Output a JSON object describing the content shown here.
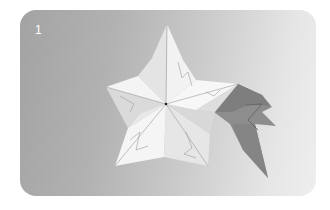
{
  "photo": {
    "step_number": "1",
    "subject": "origami-star",
    "colors": {
      "background_left": "#a3a3a3",
      "background_right": "#eeeeee",
      "paper_light": "#f4f4f4",
      "paper_mid": "#dcdcdc",
      "shadow": "#8a8a8a",
      "shadow_dark": "#7a7a7a"
    }
  }
}
